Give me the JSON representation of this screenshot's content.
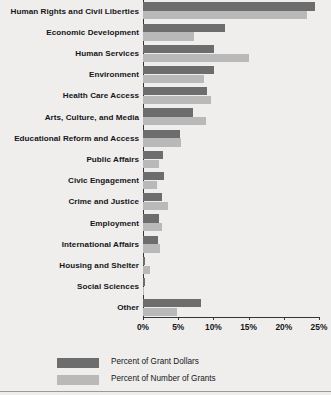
{
  "chart_data": {
    "type": "bar",
    "orientation": "horizontal",
    "title": "",
    "xlabel": "",
    "ylabel": "",
    "xlim": [
      0,
      25
    ],
    "xticks": [
      "0%",
      "5%",
      "10%",
      "15%",
      "20%",
      "25%"
    ],
    "xtick_values": [
      0,
      5,
      10,
      15,
      20,
      25
    ],
    "grid": false,
    "legend_position": "bottom-left",
    "categories": [
      "Human Rights and Civil Liberties",
      "Economic Development",
      "Human Services",
      "Environment",
      "Health Care Access",
      "Arts, Culture, and Media",
      "Educational Reform and Access",
      "Public Affairs",
      "Civic Engagement",
      "Crime and Justice",
      "Employment",
      "International Affairs",
      "Housing and Shelter",
      "Social Sciences",
      "Other"
    ],
    "series": [
      {
        "name": "Percent of Grant Dollars",
        "color": "#6d6d6d",
        "values": [
          24.4,
          11.6,
          10.1,
          10.1,
          9.1,
          7.1,
          5.3,
          2.9,
          3.0,
          2.7,
          2.3,
          2.1,
          0.3,
          0.3,
          8.3
        ]
      },
      {
        "name": "Percent of Number of Grants",
        "color": "#b9b9b9",
        "values": [
          23.3,
          7.3,
          15.0,
          8.7,
          9.7,
          9.0,
          5.4,
          2.3,
          2.0,
          3.6,
          2.7,
          2.4,
          1.0,
          0.2,
          4.9
        ]
      }
    ]
  },
  "legend": {
    "items": [
      {
        "label": "Percent of Grant Dollars",
        "color": "#6d6d6d"
      },
      {
        "label": "Percent of Number of Grants",
        "color": "#b9b9b9"
      }
    ]
  }
}
